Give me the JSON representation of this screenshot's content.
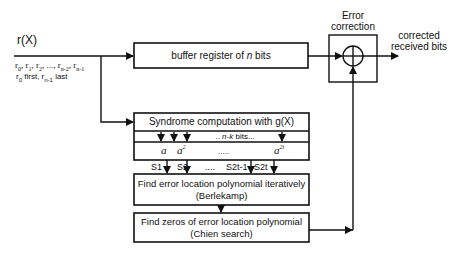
{
  "input": {
    "signal_label": "r(X)",
    "sequence_label": "r0, r1, r2, ..., rn-2, rn-1",
    "order_note": "r0 first, rn-1 last"
  },
  "buffer": {
    "label_prefix": "buffer register of ",
    "label_var": "n",
    "label_suffix": " bits"
  },
  "error_correction": {
    "title_line1": "Error",
    "title_line2": "correction",
    "operator": "XOR"
  },
  "output": {
    "line1": "corrected",
    "line2": "received bits"
  },
  "syndrome": {
    "title": "Syndrome  computation with g(X)",
    "bits_label_prefix": ".. ",
    "bits_label_var": "n-k",
    "bits_label_suffix": " bits...",
    "alpha_terms": [
      "a",
      "a",
      ".....",
      "a"
    ],
    "alpha_exponents": [
      "",
      "2",
      "",
      "2t"
    ],
    "outputs": [
      "S1",
      "S2",
      "....",
      "S2t-1",
      "S2t"
    ]
  },
  "berlekamp": {
    "line1": "Find error location polynomial  iteratively",
    "line2": "(Berlekamp)"
  },
  "chien": {
    "line1": "Find zeros of error location polynomial",
    "line2": "(Chien search)"
  }
}
